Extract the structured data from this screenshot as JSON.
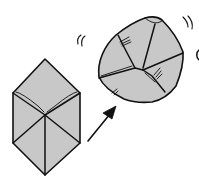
{
  "diagram": {
    "type": "origami-step-illustration",
    "colors": {
      "paper_fill": "#c8c8c8",
      "line": "#111111",
      "background": "#ffffff"
    },
    "elements": [
      {
        "id": "flat-cube",
        "label": "folded cube before inflating"
      },
      {
        "id": "arrow",
        "label": "transition arrow"
      },
      {
        "id": "inflated-cube",
        "label": "inflated rounded cube"
      },
      {
        "id": "motion-marks",
        "label": "motion / puff marks"
      }
    ]
  }
}
